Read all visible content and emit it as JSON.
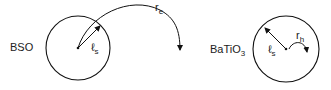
{
  "left": {
    "label": "BSO",
    "radius_label": "ℓ",
    "radius_sub": "s",
    "arc_label": "r",
    "arc_sub": "e"
  },
  "right": {
    "label_main": "BaTiO",
    "label_sub": "3",
    "radius_label": "ℓ",
    "radius_sub": "s",
    "arc_label": "r",
    "arc_sub": "h"
  },
  "colors": {
    "stroke": "#111111",
    "background": "#ffffff"
  }
}
